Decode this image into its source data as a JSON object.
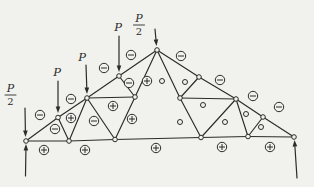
{
  "figure": {
    "kind": "truss-force-diagram",
    "colors": {
      "background": "#f1f1ed",
      "ink": "#2b2b2b"
    },
    "symbol_meaning": {
      "plus": "+",
      "minus": "−",
      "zero": ""
    },
    "nodes": {
      "A": [
        26,
        141
      ],
      "B": [
        58,
        117.5
      ],
      "D": [
        87,
        98
      ],
      "H": [
        119,
        76
      ],
      "G": [
        157,
        50
      ],
      "Hr": [
        199,
        77
      ],
      "Ir": [
        236,
        99
      ],
      "Jr2": [
        263,
        117
      ],
      "Kr": [
        294,
        137
      ],
      "C": [
        69,
        141
      ],
      "E": [
        115,
        139.5
      ],
      "Er": [
        201,
        137.5
      ],
      "Jr": [
        248,
        136.5
      ],
      "F": [
        135,
        97
      ],
      "Fr": [
        180,
        98
      ]
    },
    "members": [
      {
        "from": "A",
        "to": "B",
        "force": "minus",
        "sx": 40,
        "sy": 115
      },
      {
        "from": "B",
        "to": "D",
        "force": "minus",
        "sx": 71,
        "sy": 99
      },
      {
        "from": "D",
        "to": "H",
        "force": "minus",
        "sx": 104,
        "sy": 68
      },
      {
        "from": "H",
        "to": "G",
        "force": "minus",
        "sx": 131,
        "sy": 55
      },
      {
        "from": "G",
        "to": "Hr",
        "force": "minus",
        "sx": 181,
        "sy": 56
      },
      {
        "from": "Hr",
        "to": "Ir",
        "force": "minus",
        "sx": 220,
        "sy": 80
      },
      {
        "from": "Ir",
        "to": "Jr2",
        "force": "minus",
        "sx": 253,
        "sy": 96
      },
      {
        "from": "Jr2",
        "to": "Kr",
        "force": "minus",
        "sx": 279,
        "sy": 107
      },
      {
        "from": "A",
        "to": "C",
        "force": "plus",
        "sx": 44,
        "sy": 150
      },
      {
        "from": "C",
        "to": "E",
        "force": "plus",
        "sx": 85,
        "sy": 150
      },
      {
        "from": "E",
        "to": "Er",
        "force": "plus",
        "sx": 156,
        "sy": 148
      },
      {
        "from": "Er",
        "to": "Jr",
        "force": "plus",
        "sx": 222,
        "sy": 147
      },
      {
        "from": "Jr",
        "to": "Kr",
        "force": "plus",
        "sx": 270,
        "sy": 147
      },
      {
        "from": "B",
        "to": "C",
        "force": "minus",
        "sx": 55,
        "sy": 129
      },
      {
        "from": "C",
        "to": "D",
        "force": "plus",
        "sx": 71,
        "sy": 118
      },
      {
        "from": "D",
        "to": "E",
        "force": "minus",
        "sx": 94,
        "sy": 121
      },
      {
        "from": "D",
        "to": "F",
        "force": "plus",
        "sx": 113,
        "sy": 106
      },
      {
        "from": "E",
        "to": "F",
        "force": "plus",
        "sx": 132,
        "sy": 119
      },
      {
        "from": "H",
        "to": "F",
        "force": "minus",
        "sx": 129,
        "sy": 83
      },
      {
        "from": "G",
        "to": "F",
        "force": "plus",
        "sx": 147,
        "sy": 81
      },
      {
        "from": "G",
        "to": "Fr",
        "force": "zero",
        "sx": 162,
        "sy": 81
      },
      {
        "from": "Fr",
        "to": "Hr",
        "force": "zero",
        "sx": 185,
        "sy": 82
      },
      {
        "from": "Fr",
        "to": "Ir",
        "force": "zero",
        "sx": 203,
        "sy": 105
      },
      {
        "from": "Fr",
        "to": "Er",
        "force": "zero",
        "sx": 180,
        "sy": 122
      },
      {
        "from": "Ir",
        "to": "Er",
        "force": "zero",
        "sx": 225,
        "sy": 122
      },
      {
        "from": "Ir",
        "to": "Jr",
        "force": "zero",
        "sx": 246,
        "sy": 114
      },
      {
        "from": "Jr",
        "to": "Jr2",
        "force": "zero",
        "sx": 261,
        "sy": 127
      }
    ],
    "loads": [
      {
        "text": "P/2",
        "fraction": true,
        "num": "P",
        "den": "2",
        "lx": 10.5,
        "ly": 95,
        "arrow": [
          25,
          108,
          25.5,
          137
        ]
      },
      {
        "text": "P",
        "fraction": false,
        "lx": 57,
        "ly": 76,
        "arrow": [
          58,
          81,
          58,
          113
        ]
      },
      {
        "text": "P",
        "fraction": false,
        "lx": 82,
        "ly": 61,
        "arrow": [
          86,
          65,
          87,
          94
        ]
      },
      {
        "text": "P",
        "fraction": false,
        "lx": 118,
        "ly": 31,
        "arrow": [
          119,
          36,
          119,
          72
        ]
      },
      {
        "text": "P/2",
        "fraction": true,
        "num": "P",
        "den": "2",
        "lx": 139,
        "ly": 25,
        "arrow": [
          155,
          29,
          156.5,
          46
        ]
      }
    ],
    "reactions": [
      {
        "arrow": [
          25.5,
          176,
          26,
          144
        ]
      },
      {
        "arrow": [
          297,
          178,
          294.5,
          140
        ]
      }
    ]
  }
}
